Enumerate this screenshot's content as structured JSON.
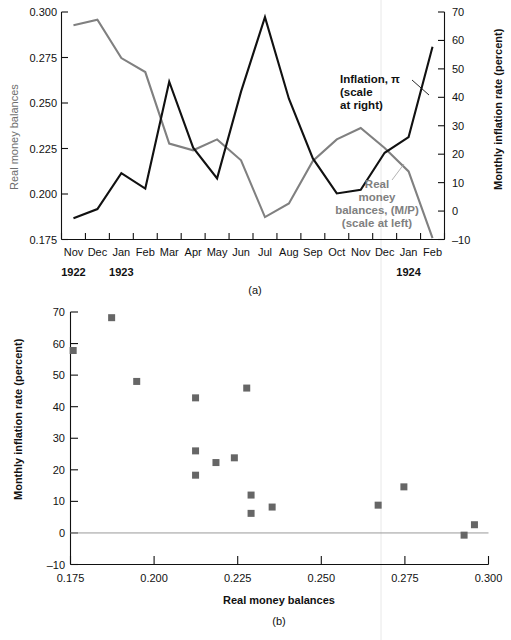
{
  "figure": {
    "panel_a_label": "(a)",
    "panel_b_label": "(b)"
  },
  "chart_data": [
    {
      "id": "panel-a",
      "type": "line",
      "title": "",
      "xlabel": "",
      "ylabel": "Real money balances",
      "y2label": "Monthly inflation rate (percent)",
      "grid": false,
      "legend_position": "inline-annotation",
      "x": [
        "Nov",
        "Dec",
        "Jan",
        "Feb",
        "Mar",
        "Apr",
        "May",
        "Jun",
        "Jul",
        "Aug",
        "Sep",
        "Oct",
        "Nov",
        "Dec",
        "Jan",
        "Feb"
      ],
      "x_year_groups": [
        {
          "label": "1922",
          "start_index": 0
        },
        {
          "label": "1923",
          "start_index": 2
        },
        {
          "label": "1924",
          "start_index": 14
        }
      ],
      "ylim": [
        0.175,
        0.3
      ],
      "yticks": [
        0.175,
        0.2,
        0.225,
        0.25,
        0.275,
        0.3
      ],
      "ytick_labels": [
        "0.175",
        "0.200",
        "0.225",
        "0.250",
        "0.275",
        "0.300"
      ],
      "y2lim": [
        -10,
        70
      ],
      "y2ticks": [
        -10,
        0,
        10,
        20,
        30,
        40,
        50,
        60,
        70
      ],
      "y2tick_labels": [
        "–10",
        "0",
        "10",
        "20",
        "30",
        "40",
        "50",
        "60",
        "70"
      ],
      "series": [
        {
          "name": "Real money balances, (M/P)",
          "axis": "left",
          "color": "#808080",
          "annotation": [
            "Real",
            "money",
            "balances, (M/P)",
            "(scale at left)"
          ],
          "values": [
            0.2927,
            0.2958,
            0.2747,
            0.267,
            0.2277,
            0.224,
            0.23,
            0.2185,
            0.1873,
            0.1948,
            0.2182,
            0.23,
            0.2363,
            0.2253,
            0.2124,
            0.1758
          ]
        },
        {
          "name": "Inflation, π",
          "axis": "right",
          "color": "#111111",
          "annotation": [
            "Inflation, π",
            "(scale",
            "at right)"
          ],
          "values": [
            -2.5,
            0.7,
            13.3,
            7.9,
            45.5,
            22.3,
            11.5,
            42.0,
            68.2,
            39.5,
            18.5,
            6.2,
            7.5,
            20.5,
            26.0,
            57.8
          ]
        }
      ]
    },
    {
      "id": "panel-b",
      "type": "scatter",
      "title": "",
      "xlabel": "Real money balances",
      "ylabel": "Monthly inflation rate (percent)",
      "grid": false,
      "legend_position": "none",
      "xlim": [
        0.175,
        0.3
      ],
      "xticks": [
        0.175,
        0.2,
        0.225,
        0.25,
        0.275,
        0.3
      ],
      "xtick_labels": [
        "0.175",
        "0.200",
        "0.225",
        "0.250",
        "0.275",
        "0.300"
      ],
      "ylim": [
        -10,
        70
      ],
      "yticks": [
        -10,
        0,
        10,
        20,
        30,
        40,
        50,
        60,
        70
      ],
      "ytick_labels": [
        "–10",
        "0",
        "10",
        "20",
        "30",
        "40",
        "50",
        "60",
        "70"
      ],
      "marker": "square",
      "marker_color": "#666666",
      "points": [
        {
          "x": 0.1758,
          "y": 57.8
        },
        {
          "x": 0.1873,
          "y": 68.2
        },
        {
          "x": 0.1948,
          "y": 48.0
        },
        {
          "x": 0.2124,
          "y": 42.8
        },
        {
          "x": 0.2124,
          "y": 26.0
        },
        {
          "x": 0.2124,
          "y": 18.3
        },
        {
          "x": 0.2185,
          "y": 22.3
        },
        {
          "x": 0.224,
          "y": 23.8
        },
        {
          "x": 0.2277,
          "y": 45.9
        },
        {
          "x": 0.229,
          "y": 12.0
        },
        {
          "x": 0.229,
          "y": 6.2
        },
        {
          "x": 0.2353,
          "y": 8.2
        },
        {
          "x": 0.267,
          "y": 8.8
        },
        {
          "x": 0.2747,
          "y": 14.6
        },
        {
          "x": 0.2927,
          "y": -0.7
        },
        {
          "x": 0.2958,
          "y": 2.6
        }
      ]
    }
  ]
}
